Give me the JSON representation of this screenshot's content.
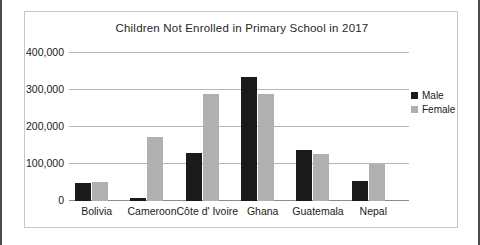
{
  "chart_data": {
    "type": "bar",
    "title": "Children Not Enrolled in Primary School in 2017",
    "xlabel": "",
    "ylabel": "",
    "ylim": [
      0,
      400000
    ],
    "yticks": [
      0,
      100000,
      200000,
      300000,
      400000
    ],
    "ytick_labels": [
      "0",
      "100,000",
      "200,000",
      "300,000",
      "400,000"
    ],
    "grid": true,
    "legend_position": "right",
    "categories": [
      "Bolivia",
      "Cameroon",
      "Côte d' Ivoire",
      "Ghana",
      "Guatemala",
      "Nepal"
    ],
    "series": [
      {
        "name": "Male",
        "color": "#1a1a1a",
        "values": [
          48000,
          9000,
          130000,
          335000,
          138000,
          53000
        ]
      },
      {
        "name": "Female",
        "color": "#b0b0b0",
        "values": [
          52000,
          173000,
          288000,
          288000,
          127000,
          100000
        ]
      }
    ]
  },
  "legend": {
    "items": [
      {
        "label": "Male",
        "color": "#1a1a1a"
      },
      {
        "label": "Female",
        "color": "#b0b0b0"
      }
    ]
  }
}
